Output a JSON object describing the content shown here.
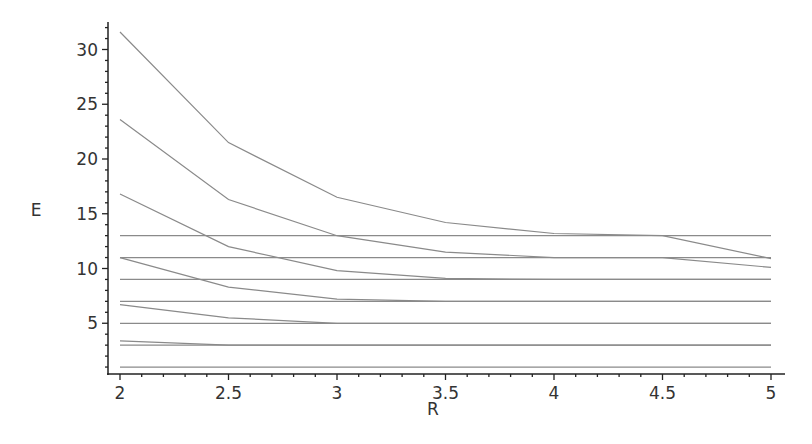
{
  "chart_data": {
    "type": "line",
    "title": "",
    "xlabel": "R",
    "ylabel": "E",
    "xlim": [
      2,
      5
    ],
    "ylim": [
      0,
      32
    ],
    "grid": false,
    "legend": null,
    "x_ticks": [
      2,
      2.5,
      3,
      3.5,
      4,
      4.5,
      5
    ],
    "x_tick_labels": [
      "2",
      "2.5",
      "3",
      "3.5",
      "4",
      "4.5",
      "5"
    ],
    "y_ticks": [
      5,
      10,
      15,
      20,
      25,
      30
    ],
    "y_tick_labels": [
      "5",
      "10",
      "15",
      "20",
      "25",
      "30"
    ],
    "x": [
      2,
      2.5,
      3,
      3.5,
      4,
      4.5,
      5
    ],
    "series": [
      {
        "name": "curve-1",
        "values": [
          31.6,
          21.5,
          16.5,
          14.2,
          13.2,
          13.0,
          10.9
        ]
      },
      {
        "name": "curve-2",
        "values": [
          23.6,
          16.3,
          13.0,
          11.5,
          11.0,
          11.0,
          10.1
        ]
      },
      {
        "name": "curve-3",
        "values": [
          16.8,
          12.0,
          9.8,
          9.1,
          9.0,
          9.0,
          9.0
        ]
      },
      {
        "name": "curve-4",
        "values": [
          11.0,
          8.3,
          7.2,
          7.0,
          7.0,
          7.0,
          7.0
        ]
      },
      {
        "name": "curve-5",
        "values": [
          6.7,
          5.5,
          5.0,
          5.0,
          5.0,
          5.0,
          5.0
        ]
      },
      {
        "name": "curve-6",
        "values": [
          3.4,
          3.0,
          3.0,
          3.0,
          3.0,
          3.0,
          3.0
        ]
      },
      {
        "name": "level-13",
        "values": [
          13,
          13,
          13,
          13,
          13,
          13,
          13
        ]
      },
      {
        "name": "level-11",
        "values": [
          11,
          11,
          11,
          11,
          11,
          11,
          11
        ]
      },
      {
        "name": "level-9",
        "values": [
          9,
          9,
          9,
          9,
          9,
          9,
          9
        ]
      },
      {
        "name": "level-7",
        "values": [
          7,
          7,
          7,
          7,
          7,
          7,
          7
        ]
      },
      {
        "name": "level-5",
        "values": [
          5,
          5,
          5,
          5,
          5,
          5,
          5
        ]
      },
      {
        "name": "level-3",
        "values": [
          3,
          3,
          3,
          3,
          3,
          3,
          3
        ]
      },
      {
        "name": "level-1",
        "values": [
          1,
          1,
          1,
          1,
          1,
          1,
          1
        ]
      }
    ],
    "colors": {
      "line": "#8a8a8a",
      "axis": "#222222",
      "text": "#333333"
    }
  }
}
